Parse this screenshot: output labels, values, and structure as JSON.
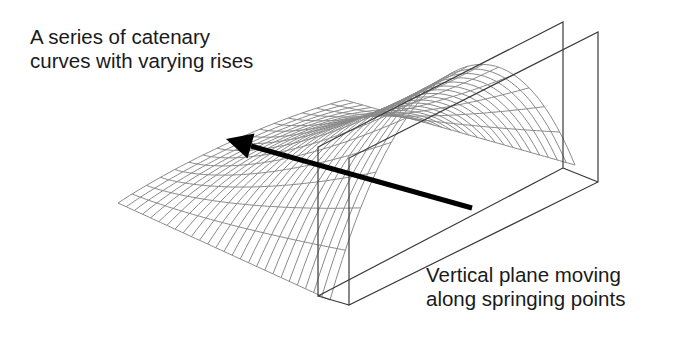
{
  "diagram": {
    "labels": {
      "catenary": {
        "line1": "A series of catenary",
        "line2": "curves with varying rises"
      },
      "plane": {
        "line1": "Vertical plane moving",
        "line2": "along springing points"
      }
    },
    "colors": {
      "background": "#ffffff",
      "mesh": "#8a8a8a",
      "plane": "#3a3a3a",
      "arrow": "#000000",
      "text": "#1a1a1a"
    },
    "arrow": {
      "from": [
        472,
        208
      ],
      "to": [
        226,
        139
      ]
    },
    "planes": [
      {
        "name": "plane-1",
        "front_bottom": [
          318,
          296
        ],
        "front_top": [
          318,
          147
        ],
        "back_top": [
          563,
          22
        ],
        "back_bottom": [
          563,
          168
        ]
      },
      {
        "name": "plane-2",
        "front_bottom": [
          349,
          305
        ],
        "front_top": [
          349,
          158
        ],
        "back_top": [
          598,
          32
        ],
        "back_bottom": [
          598,
          182
        ]
      }
    ]
  }
}
